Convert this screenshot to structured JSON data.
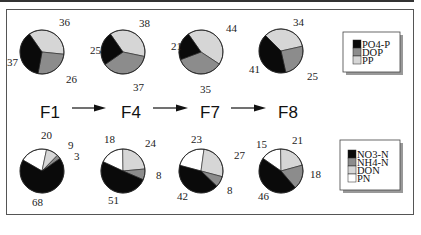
{
  "chart_data": [
    {
      "type": "pie",
      "title": "Phosphorus fractions (%)",
      "legend": [
        "PO4-P",
        "DOP",
        "PP"
      ],
      "colors": {
        "PO4-P": "#0a0a0a",
        "DOP": "#8c8c8c",
        "PP": "#d6d6d6"
      },
      "legend_position": "right",
      "categories": [
        "F1",
        "F4",
        "F7",
        "F8"
      ],
      "series": [
        {
          "name": "F1",
          "values": {
            "PO4-P": 37,
            "DOP": 26,
            "PP": 36
          }
        },
        {
          "name": "F4",
          "values": {
            "PO4-P": 25,
            "DOP": 37,
            "PP": 38
          }
        },
        {
          "name": "F7",
          "values": {
            "PO4-P": 21,
            "DOP": 35,
            "PP": 44
          }
        },
        {
          "name": "F8",
          "values": {
            "PO4-P": 41,
            "DOP": 25,
            "PP": 34
          }
        }
      ]
    },
    {
      "type": "pie",
      "title": "Nitrogen fractions (%)",
      "legend": [
        "NO3-N",
        "NH4-N",
        "DON",
        "PN"
      ],
      "colors": {
        "NO3-N": "#0a0a0a",
        "NH4-N": "#8c8c8c",
        "DON": "#d6d6d6",
        "PN": "#ffffff"
      },
      "legend_position": "right",
      "categories": [
        "F1",
        "F4",
        "F7",
        "F8"
      ],
      "series": [
        {
          "name": "F1",
          "values": {
            "NO3-N": 68,
            "NH4-N": 3,
            "DON": 9,
            "PN": 20
          }
        },
        {
          "name": "F4",
          "values": {
            "NO3-N": 51,
            "NH4-N": 8,
            "DON": 24,
            "PN": 18
          }
        },
        {
          "name": "F7",
          "values": {
            "NO3-N": 42,
            "NH4-N": 8,
            "DON": 27,
            "PN": 23
          }
        },
        {
          "name": "F8",
          "values": {
            "NO3-N": 46,
            "NH4-N": 18,
            "DON": 21,
            "PN": 15
          }
        }
      ]
    }
  ],
  "sequence": {
    "labels": [
      "F1",
      "F4",
      "F7",
      "F8"
    ],
    "arrow": "right-arrow"
  },
  "top_legend": {
    "items": [
      "PO4-P",
      "DOP",
      "PP"
    ]
  },
  "bottom_legend": {
    "items": [
      "NO3-N",
      "NH4-N",
      "DON",
      "PN"
    ]
  },
  "top_pies": [
    {
      "id": "F1",
      "labels": [
        "37",
        "26",
        "36"
      ]
    },
    {
      "id": "F4",
      "labels": [
        "25",
        "37",
        "38"
      ]
    },
    {
      "id": "F7",
      "labels": [
        "21",
        "35",
        "44"
      ]
    },
    {
      "id": "F8",
      "labels": [
        "41",
        "25",
        "34"
      ]
    }
  ],
  "bottom_pies": [
    {
      "id": "F1",
      "labels": [
        "68",
        "3",
        "9",
        "20"
      ]
    },
    {
      "id": "F4",
      "labels": [
        "51",
        "8",
        "24",
        "18"
      ]
    },
    {
      "id": "F7",
      "labels": [
        "42",
        "8",
        "27",
        "23"
      ]
    },
    {
      "id": "F8",
      "labels": [
        "46",
        "18",
        "21",
        "15"
      ]
    }
  ]
}
